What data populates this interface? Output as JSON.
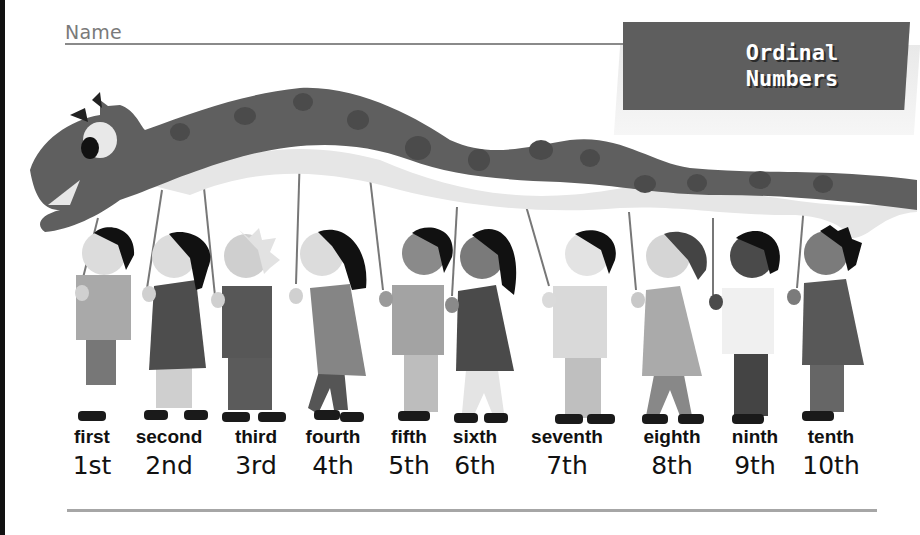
{
  "worksheet": {
    "name_label": "Name",
    "title_line1": "Ordinal",
    "title_line2": "Numbers"
  },
  "ordinals": [
    {
      "word": "first",
      "number": "1st",
      "x": 92
    },
    {
      "word": "second",
      "number": "2nd",
      "x": 169
    },
    {
      "word": "third",
      "number": "3rd",
      "x": 256
    },
    {
      "word": "fourth",
      "number": "4th",
      "x": 333
    },
    {
      "word": "fifth",
      "number": "5th",
      "x": 409
    },
    {
      "word": "sixth",
      "number": "6th",
      "x": 475
    },
    {
      "word": "seventh",
      "number": "7th",
      "x": 567
    },
    {
      "word": "eighth",
      "number": "8th",
      "x": 672
    },
    {
      "word": "ninth",
      "number": "9th",
      "x": 755
    },
    {
      "word": "tenth",
      "number": "10th",
      "x": 831
    }
  ],
  "illustration": {
    "subject": "ten children carrying a dragon puppet on sticks",
    "colors": {
      "dragon_body": "#5f5f5f",
      "dragon_spots": "#4a4a4a",
      "dragon_belly": "#e8e8e8",
      "hair_dark": "#111111",
      "shoes": "#1a1a1a"
    }
  }
}
